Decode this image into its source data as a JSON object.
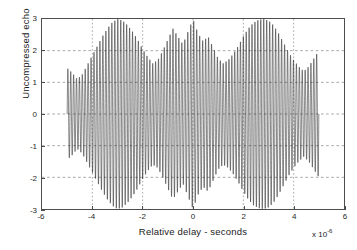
{
  "figure": {
    "background_color": "#ffffff",
    "axis_color": "#4d4d4d",
    "grid_color": "#808080",
    "signal_color": "#101010"
  },
  "axes": {
    "x_tick_labels": [
      "-6",
      "-4",
      "-2",
      "0",
      "2",
      "4",
      "6"
    ],
    "y_tick_labels": [
      "3",
      "2",
      "1",
      "0",
      "-1",
      "-2",
      "-3"
    ],
    "x_exponent_prefix": "x 10",
    "x_exponent_power": "-6"
  },
  "chart_data": {
    "type": "line",
    "title": "",
    "subtitle": "",
    "xlabel": "Relative delay - seconds",
    "ylabel": "Uncompressed echo",
    "xlim": [
      -6,
      6
    ],
    "ylim": [
      -3,
      3
    ],
    "x_ticks": [
      -6,
      -4,
      -2,
      0,
      2,
      4,
      6
    ],
    "y_ticks": [
      -3,
      -2,
      -1,
      0,
      1,
      2,
      3
    ],
    "x_scale_exponent": -6,
    "x_units": "seconds",
    "grid": true,
    "grid_style": "dashed",
    "legend": null,
    "legend_position": "none",
    "series": [
      {
        "name": "Uncompressed echo",
        "color": "#101010",
        "signal_support": [
          -5,
          5
        ],
        "carrier_cycles_over_support": 86,
        "envelope_description": "Two large outer lobes peaking near -3 and +3 at amplitude 3, a sparse low-amplitude central region around 0 with an isolated peak reaching 3 at t=0, and notches near -4.6 and +4.4.",
        "envelope_x": [
          -5.0,
          -4.8,
          -4.6,
          -4.4,
          -4.2,
          -4.0,
          -3.8,
          -3.6,
          -3.4,
          -3.2,
          -3.0,
          -2.8,
          -2.6,
          -2.4,
          -2.2,
          -2.0,
          -1.8,
          -1.6,
          -1.4,
          -1.2,
          -1.0,
          -0.8,
          -0.6,
          -0.4,
          -0.2,
          0.0,
          0.2,
          0.4,
          0.6,
          0.8,
          1.0,
          1.2,
          1.4,
          1.6,
          1.8,
          2.0,
          2.2,
          2.4,
          2.6,
          2.8,
          3.0,
          3.2,
          3.4,
          3.6,
          3.8,
          4.0,
          4.2,
          4.4,
          4.6,
          4.8,
          5.0
        ],
        "envelope_y": [
          1.45,
          1.3,
          1.1,
          1.25,
          1.55,
          1.85,
          2.15,
          2.45,
          2.7,
          2.9,
          3.0,
          2.95,
          2.8,
          2.6,
          2.35,
          2.05,
          1.8,
          1.6,
          1.7,
          2.0,
          2.35,
          2.7,
          2.45,
          2.2,
          2.6,
          3.0,
          2.55,
          2.3,
          2.45,
          2.1,
          1.75,
          1.6,
          1.7,
          1.9,
          2.15,
          2.45,
          2.7,
          2.88,
          2.97,
          3.0,
          2.95,
          2.8,
          2.55,
          2.25,
          1.95,
          1.7,
          1.5,
          1.35,
          1.5,
          1.75,
          2.0
        ],
        "peak_amplitude": 3.0,
        "min_amplitude": -3.0
      }
    ]
  }
}
